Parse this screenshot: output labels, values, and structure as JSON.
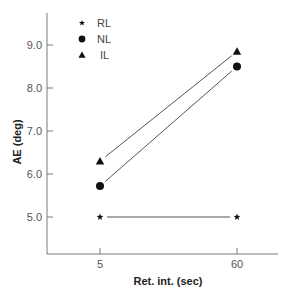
{
  "chart_data": {
    "type": "line",
    "title": "",
    "xlabel": "Ret. int. (sec)",
    "ylabel": "AE (deg)",
    "categories": [
      "5",
      "60"
    ],
    "x": [
      5,
      60
    ],
    "yticks": [
      "5.0",
      "6.0",
      "7.0",
      "8.0",
      "9.0"
    ],
    "ylim": [
      4.1,
      9.7
    ],
    "grid": false,
    "legend_position": "upper left",
    "series": [
      {
        "name": "RL",
        "marker": "star",
        "values": [
          5.0,
          5.0
        ]
      },
      {
        "name": "NL",
        "marker": "circle",
        "values": [
          5.72,
          8.5
        ]
      },
      {
        "name": "IL",
        "marker": "triangle",
        "values": [
          6.3,
          8.85
        ]
      }
    ]
  },
  "colors": {
    "axis": "#7a7a7a",
    "line": "#555555",
    "marker": "#111111"
  }
}
